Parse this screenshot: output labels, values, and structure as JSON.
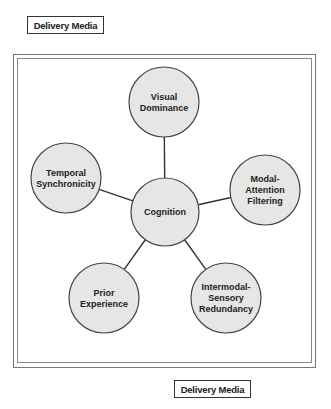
{
  "labels": {
    "top": "Delivery Media",
    "bottom": "Delivery Media"
  },
  "diagram": {
    "center": {
      "id": "cognition",
      "lines": [
        "Cognition"
      ],
      "cx": 165,
      "cy": 212,
      "r": 34
    },
    "nodes": [
      {
        "id": "visual-dominance",
        "lines": [
          "Visual",
          "Dominance"
        ],
        "cx": 164,
        "cy": 102,
        "r": 35
      },
      {
        "id": "temporal-synchronicity",
        "lines": [
          "Temporal",
          "Synchronicity"
        ],
        "cx": 66,
        "cy": 178,
        "r": 35
      },
      {
        "id": "modal-attention-filtering",
        "lines": [
          "Modal-",
          "Attention",
          "Filtering"
        ],
        "cx": 265,
        "cy": 190,
        "r": 35
      },
      {
        "id": "prior-experience",
        "lines": [
          "Prior",
          "Experience"
        ],
        "cx": 104,
        "cy": 298,
        "r": 35
      },
      {
        "id": "intermodal-sensory-redundancy",
        "lines": [
          "Intermodal-",
          "Sensory",
          "Redundancy"
        ],
        "cx": 226,
        "cy": 298,
        "r": 35
      }
    ],
    "colors": {
      "fill": "#e6e6e6",
      "stroke": "#444444",
      "edge": "#333333"
    }
  }
}
